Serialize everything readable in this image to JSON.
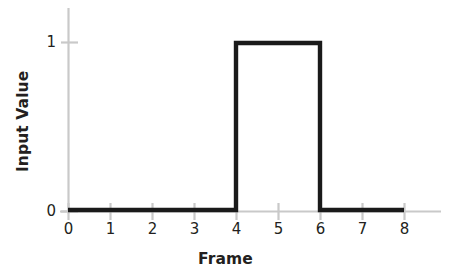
{
  "chart_data": {
    "type": "line",
    "title": "",
    "subtitle": "",
    "xlabel": "Frame",
    "ylabel": "Input Value",
    "x": [
      0,
      1,
      2,
      3,
      4,
      5,
      6,
      7,
      8
    ],
    "values": [
      0,
      0,
      0,
      0,
      1,
      1,
      0,
      0,
      0
    ],
    "series": [
      {
        "name": "Input Value",
        "values": [
          0,
          0,
          0,
          0,
          1,
          1,
          0,
          0,
          0
        ]
      }
    ],
    "step_points": [
      {
        "frame": 0,
        "value": 0
      },
      {
        "frame": 4,
        "value": 0
      },
      {
        "frame": 4,
        "value": 1
      },
      {
        "frame": 6,
        "value": 1
      },
      {
        "frame": 6,
        "value": 0
      },
      {
        "frame": 8,
        "value": 0
      }
    ],
    "xlim": [
      0,
      8
    ],
    "ylim": [
      0,
      1
    ],
    "xticks": [
      "0",
      "1",
      "2",
      "3",
      "4",
      "5",
      "6",
      "7",
      "8"
    ],
    "yticks": [
      "0",
      "1"
    ],
    "grid": false,
    "legend": null,
    "legend_position": "none",
    "interpolation": "step-post",
    "annotations": [],
    "colors": {
      "line": "#1a1a1a",
      "axis": "#c9c9c9",
      "text": "#231f20",
      "background": "#ffffff"
    }
  },
  "axes": {
    "x_title": "Frame",
    "y_title": "Input Value",
    "x_tick_labels": [
      "0",
      "1",
      "2",
      "3",
      "4",
      "5",
      "6",
      "7",
      "8"
    ],
    "y_tick_labels": [
      "1",
      "0"
    ]
  }
}
